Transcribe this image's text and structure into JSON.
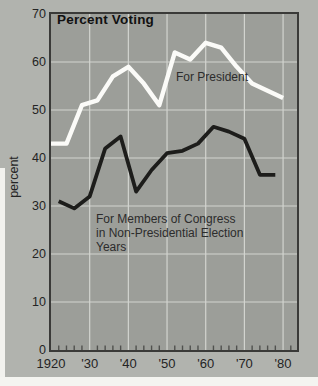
{
  "figure": {
    "title": "Percent Voting",
    "y_axis_title": "percent",
    "series_labels": {
      "president": "For President",
      "congress_line1": "For Members of Congress",
      "congress_line2": "in Non-Presidential Election",
      "congress_line3": "Years"
    }
  },
  "colors": {
    "page_margin": "#b1b3ae",
    "plot_background": "#9c9e99",
    "frame": "#3a3a38",
    "gridline": "#d2d4cf",
    "minor_tick": "#50514e",
    "president_line": "#fbfbf8",
    "congress_line": "#1d1d1b",
    "text": "#242424"
  },
  "chart_data": {
    "type": "line",
    "title": "Percent Voting",
    "xlabel": "",
    "ylabel": "percent",
    "xlim": [
      1920,
      1983.6
    ],
    "ylim": [
      0,
      70
    ],
    "grid": true,
    "legend_position": "inline-annotations",
    "y_ticks": [
      0,
      10,
      20,
      30,
      40,
      50,
      60,
      70
    ],
    "x_ticks": [
      {
        "year": 1920,
        "label": "1920"
      },
      {
        "year": 1930,
        "label": "'30"
      },
      {
        "year": 1940,
        "label": "'40"
      },
      {
        "year": 1950,
        "label": "'50"
      },
      {
        "year": 1960,
        "label": "'60"
      },
      {
        "year": 1970,
        "label": "'70"
      },
      {
        "year": 1980,
        "label": "'80"
      }
    ],
    "minor_tick_interval_years": 2,
    "series": [
      {
        "name": "For President",
        "color": "#fbfbf8",
        "stroke_width": 4.4,
        "x": [
          1920,
          1924,
          1928,
          1932,
          1936,
          1940,
          1944,
          1948,
          1952,
          1956,
          1960,
          1964,
          1968,
          1972,
          1976,
          1980
        ],
        "values": [
          43,
          43,
          51,
          52,
          57,
          59,
          55.5,
          51,
          62,
          60.5,
          64,
          63,
          59,
          55.5,
          54,
          52.5
        ]
      },
      {
        "name": "For Members of Congress in Non-Presidential Election Years",
        "color": "#1d1d1b",
        "stroke_width": 3.8,
        "x": [
          1922,
          1926,
          1930,
          1934,
          1938,
          1942,
          1946,
          1950,
          1954,
          1958,
          1962,
          1966,
          1970,
          1974,
          1978
        ],
        "values": [
          31,
          29.5,
          32,
          42,
          44.5,
          33,
          37.5,
          41,
          41.5,
          43,
          46.5,
          45.5,
          44,
          36.5,
          36.5
        ]
      }
    ]
  }
}
